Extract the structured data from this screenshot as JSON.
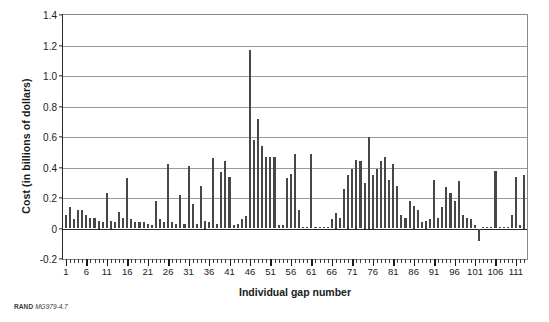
{
  "figure": {
    "credit_org": "RAND",
    "credit_number": "MG979-4.7"
  },
  "chart_data": {
    "type": "bar",
    "title": "",
    "xlabel": "Individual gap number",
    "ylabel": "Cost (in billions of dollars)",
    "ylim": [
      -0.2,
      1.4
    ],
    "ytick_values": [
      1.4,
      1.2,
      1.0,
      0.8,
      0.6,
      0.4,
      0.2,
      0,
      -0.2
    ],
    "ytick_labels": [
      "1.4",
      "1.2",
      "1.0",
      "0.8",
      "0.6",
      "0.4",
      "0.2",
      "0",
      "-0.2"
    ],
    "xlim": [
      0.3,
      113.7
    ],
    "xtick_labels": [
      "1",
      "6",
      "11",
      "16",
      "21",
      "26",
      "31",
      "36",
      "41",
      "46",
      "51",
      "56",
      "61",
      "66",
      "71",
      "76",
      "81",
      "86",
      "91",
      "96",
      "101",
      "106",
      "111"
    ],
    "xtick_values": [
      1,
      6,
      11,
      16,
      21,
      26,
      31,
      36,
      41,
      46,
      51,
      56,
      61,
      66,
      71,
      76,
      81,
      86,
      91,
      96,
      101,
      106,
      111
    ],
    "grid": "horizontal",
    "legend": "none",
    "bar_color": "#474747",
    "n_bars": 113,
    "categories": [
      1,
      2,
      3,
      4,
      5,
      6,
      7,
      8,
      9,
      10,
      11,
      12,
      13,
      14,
      15,
      16,
      17,
      18,
      19,
      20,
      21,
      22,
      23,
      24,
      25,
      26,
      27,
      28,
      29,
      30,
      31,
      32,
      33,
      34,
      35,
      36,
      37,
      38,
      39,
      40,
      41,
      42,
      43,
      44,
      45,
      46,
      47,
      48,
      49,
      50,
      51,
      52,
      53,
      54,
      55,
      56,
      57,
      58,
      59,
      60,
      61,
      62,
      63,
      64,
      65,
      66,
      67,
      68,
      69,
      70,
      71,
      72,
      73,
      74,
      75,
      76,
      77,
      78,
      79,
      80,
      81,
      82,
      83,
      84,
      85,
      86,
      87,
      88,
      89,
      90,
      91,
      92,
      93,
      94,
      95,
      96,
      97,
      98,
      99,
      100,
      101,
      102,
      103,
      104,
      105,
      106,
      107,
      108,
      109,
      110,
      111,
      112,
      113
    ],
    "values": [
      0.09,
      0.14,
      0.06,
      0.12,
      0.12,
      0.09,
      0.07,
      0.07,
      0.05,
      0.04,
      0.23,
      0.05,
      0.04,
      0.11,
      0.07,
      0.33,
      0.06,
      0.04,
      0.04,
      0.04,
      0.03,
      0.02,
      0.18,
      0.06,
      0.04,
      0.42,
      0.04,
      0.03,
      0.22,
      0.03,
      0.41,
      0.16,
      0.03,
      0.28,
      0.05,
      0.04,
      0.46,
      0.03,
      0.37,
      0.44,
      0.34,
      0.02,
      0.03,
      0.06,
      0.08,
      1.17,
      0.58,
      0.72,
      0.54,
      0.47,
      0.47,
      0.47,
      0.02,
      0.02,
      0.33,
      0.36,
      0.49,
      0.12,
      0.01,
      0.01,
      0.49,
      0.01,
      0.01,
      0.01,
      0.01,
      0.06,
      0.1,
      0.07,
      0.26,
      0.35,
      0.39,
      0.45,
      0.44,
      0.3,
      0.6,
      0.35,
      0.39,
      0.44,
      0.47,
      0.32,
      0.42,
      0.28,
      0.09,
      0.07,
      0.18,
      0.15,
      0.12,
      0.04,
      0.05,
      0.06,
      0.32,
      0.07,
      0.14,
      0.27,
      0.23,
      0.18,
      0.31,
      0.09,
      0.07,
      0.06,
      0.02,
      -0.08,
      0.01,
      0.01,
      0.01,
      0.38,
      0.01,
      0.01,
      0.01,
      0.09,
      0.34,
      0.02,
      0.35
    ]
  }
}
